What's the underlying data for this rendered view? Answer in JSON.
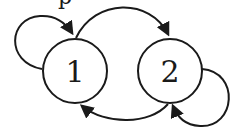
{
  "diagram": {
    "type": "state-transition-graph",
    "stroke_color": "#1a1a1a",
    "background": "#ffffff",
    "cropped_top_text": "p",
    "nodes": [
      {
        "id": "1",
        "label": "1"
      },
      {
        "id": "2",
        "label": "2"
      }
    ],
    "edges": [
      {
        "from": "1",
        "to": "1",
        "kind": "self-loop"
      },
      {
        "from": "1",
        "to": "2",
        "kind": "arc-top"
      },
      {
        "from": "2",
        "to": "1",
        "kind": "arc-bottom"
      },
      {
        "from": "2",
        "to": "2",
        "kind": "self-loop"
      }
    ]
  }
}
